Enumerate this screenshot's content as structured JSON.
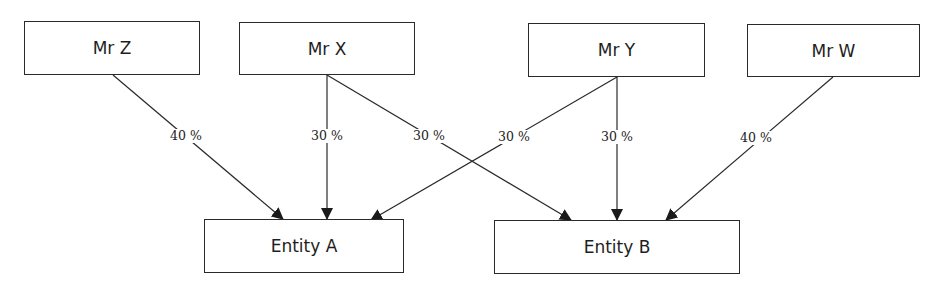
{
  "diagram": {
    "type": "ownership-structure",
    "owners": [
      {
        "id": "mr_z",
        "label": "Mr Z",
        "box": [
          24,
          21,
          176,
          54
        ]
      },
      {
        "id": "mr_x",
        "label": "Mr X",
        "box": [
          239,
          22,
          176,
          53
        ]
      },
      {
        "id": "mr_y",
        "label": "Mr Y",
        "box": [
          528,
          23,
          177,
          54
        ]
      },
      {
        "id": "mr_w",
        "label": "Mr W",
        "box": [
          747,
          24,
          173,
          53
        ]
      }
    ],
    "entities": [
      {
        "id": "entity_a",
        "label": "Entity A",
        "box": [
          204,
          219,
          200,
          54
        ]
      },
      {
        "id": "entity_b",
        "label": "Entity B",
        "box": [
          494,
          220,
          246,
          54
        ]
      }
    ],
    "edges": [
      {
        "from": "mr_z",
        "to": "entity_a",
        "label": "40 %",
        "start": [
          113,
          75
        ],
        "end": [
          283,
          219
        ],
        "label_pos": [
          186,
          136
        ]
      },
      {
        "from": "mr_x",
        "to": "entity_a",
        "label": "30 %",
        "start": [
          327,
          75
        ],
        "end": [
          327,
          219
        ],
        "label_pos": [
          327,
          136
        ]
      },
      {
        "from": "mr_x",
        "to": "entity_b",
        "label": "30 %",
        "start": [
          327,
          75
        ],
        "end": [
          571,
          220
        ],
        "label_pos": [
          429,
          136
        ]
      },
      {
        "from": "mr_y",
        "to": "entity_a",
        "label": "30 %",
        "start": [
          617,
          77
        ],
        "end": [
          371,
          220
        ],
        "label_pos": [
          514,
          137
        ]
      },
      {
        "from": "mr_y",
        "to": "entity_b",
        "label": "30 %",
        "start": [
          617,
          77
        ],
        "end": [
          617,
          220
        ],
        "label_pos": [
          617,
          137
        ]
      },
      {
        "from": "mr_w",
        "to": "entity_b",
        "label": "40 %",
        "start": [
          833,
          77
        ],
        "end": [
          666,
          220
        ],
        "label_pos": [
          756,
          138
        ]
      }
    ],
    "colors": {
      "stroke": "#2a2a2a",
      "text": "#1e1e1e",
      "background": "#ffffff"
    }
  }
}
